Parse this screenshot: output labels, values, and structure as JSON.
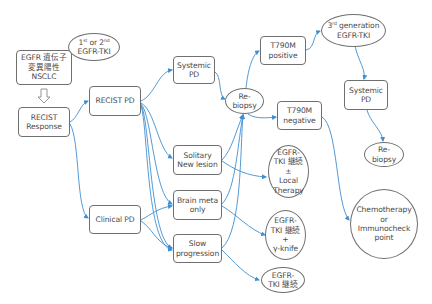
{
  "diagram": {
    "edge_color": "#3f8fd0",
    "nodes": {
      "egfr_nsclc": "EGFR 遺伝子\n変異陽性\nNSCLC",
      "first_second_tki_a": "1",
      "first_second_tki_sup1": "st",
      "first_second_tki_b": " or 2",
      "first_second_tki_sup2": "nd",
      "first_second_tki_c": "EGFR-TKI",
      "recist_response": "RECIST\nResponse",
      "recist_pd": "RECIST PD",
      "clinical_pd": "Clinical PD",
      "systemic_pd_1": "Systemic\nPD",
      "solitary_new_lesion": "Solitary\nNew lesion",
      "brain_meta_only": "Brain meta\nonly",
      "slow_progression": "Slow\nprogression",
      "rebiopsy_1": "Re-\nbiopsy",
      "t790m_positive": "T790M\npositive",
      "t790m_negative": "T790M\nnegative",
      "third_gen_a": "3",
      "third_gen_sup": "rd",
      "third_gen_b": " generation",
      "third_gen_c": "EGFR-TKI",
      "systemic_pd_2": "Systemic\nPD",
      "rebiopsy_2": "Re-\nbiopsy",
      "tki_continue_local": "EGFR-\nTKI 継続\n±\nLocal\nTherapy",
      "tki_continue_gamma": "EGFR-\nTKI 継続\n+\nγ-knife",
      "tki_continue": "EGFR-\nTKI 継続",
      "chemo_immuno": "Chemotherapy\nor\nImmunocheck\npoint"
    },
    "edges": [
      {
        "from": "egfr_nsclc",
        "to": "recist_response",
        "style": "hollow-down-arrow"
      },
      {
        "from": "recist_response",
        "to": "recist_pd"
      },
      {
        "from": "recist_response",
        "to": "clinical_pd"
      },
      {
        "from": "recist_pd",
        "to": "systemic_pd_1"
      },
      {
        "from": "recist_pd",
        "to": "solitary_new_lesion"
      },
      {
        "from": "recist_pd",
        "to": "brain_meta_only"
      },
      {
        "from": "recist_pd",
        "to": "slow_progression"
      },
      {
        "from": "clinical_pd",
        "to": "brain_meta_only"
      },
      {
        "from": "clinical_pd",
        "to": "slow_progression"
      },
      {
        "from": "systemic_pd_1",
        "to": "rebiopsy_1"
      },
      {
        "from": "solitary_new_lesion",
        "to": "rebiopsy_1"
      },
      {
        "from": "brain_meta_only",
        "to": "rebiopsy_1"
      },
      {
        "from": "slow_progression",
        "to": "rebiopsy_1"
      },
      {
        "from": "solitary_new_lesion",
        "to": "tki_continue_local"
      },
      {
        "from": "brain_meta_only",
        "to": "tki_continue_gamma"
      },
      {
        "from": "slow_progression",
        "to": "tki_continue"
      },
      {
        "from": "rebiopsy_1",
        "to": "t790m_positive"
      },
      {
        "from": "rebiopsy_1",
        "to": "t790m_negative"
      },
      {
        "from": "t790m_positive",
        "to": "third_gen_egfr_tki"
      },
      {
        "from": "third_gen_egfr_tki",
        "to": "systemic_pd_2"
      },
      {
        "from": "systemic_pd_2",
        "to": "rebiopsy_2"
      },
      {
        "from": "t790m_negative",
        "to": "chemo_immuno"
      }
    ]
  }
}
